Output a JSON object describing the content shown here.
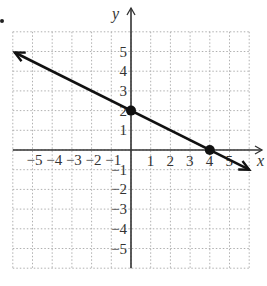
{
  "chart_data": {
    "type": "line",
    "title": "",
    "xlabel": "x",
    "ylabel": "y",
    "xlim": [
      -6,
      6
    ],
    "ylim": [
      -6,
      6
    ],
    "grid": true,
    "grid_style": "dotted",
    "x_tick_labels": [
      "-5",
      "-4",
      "-3",
      "-2",
      "-1",
      "1",
      "2",
      "3",
      "4",
      "5"
    ],
    "y_tick_labels": [
      "5",
      "4",
      "3",
      "2",
      "1",
      "-1",
      "-2",
      "-3",
      "-4",
      "-5"
    ],
    "series": [
      {
        "name": "line",
        "equation": "y = -0.5x + 2",
        "slope": -0.5,
        "intercept": 2,
        "arrows": "both",
        "x": [
          -5.9,
          6.0
        ],
        "y": [
          4.95,
          -1.0
        ]
      }
    ],
    "points": [
      {
        "label": "y-intercept",
        "x": 0,
        "y": 2
      },
      {
        "label": "x-intercept",
        "x": 4,
        "y": 0
      }
    ],
    "colors": {
      "line": "#111111",
      "axes": "#333333",
      "grid": "#b0b0b0"
    }
  },
  "labels": {
    "x_axis": "x",
    "y_axis": "y",
    "x_ticks": [
      {
        "v": -5,
        "t": "−5"
      },
      {
        "v": -4,
        "t": "−4"
      },
      {
        "v": -3,
        "t": "−3"
      },
      {
        "v": -2,
        "t": "−2"
      },
      {
        "v": -1,
        "t": "−1"
      },
      {
        "v": 1,
        "t": "1"
      },
      {
        "v": 2,
        "t": "2"
      },
      {
        "v": 3,
        "t": "3"
      },
      {
        "v": 4,
        "t": "4"
      },
      {
        "v": 5,
        "t": "5"
      }
    ],
    "y_ticks": [
      {
        "v": 5,
        "t": "5"
      },
      {
        "v": 4,
        "t": "4"
      },
      {
        "v": 3,
        "t": "3"
      },
      {
        "v": 2,
        "t": "2"
      },
      {
        "v": 1,
        "t": "1"
      },
      {
        "v": -1,
        "t": "−1"
      },
      {
        "v": -2,
        "t": "−2"
      },
      {
        "v": -3,
        "t": "−3"
      },
      {
        "v": -4,
        "t": "−4"
      },
      {
        "v": -5,
        "t": "−5"
      }
    ]
  }
}
